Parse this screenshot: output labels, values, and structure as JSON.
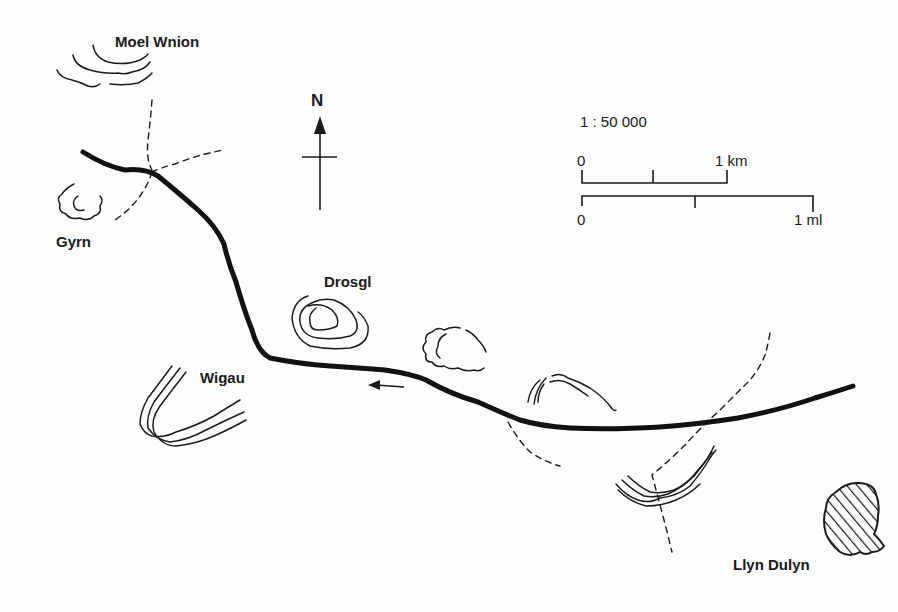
{
  "map": {
    "labels": {
      "moel_wnion": "Moel Wnion",
      "gyrn": "Gyrn",
      "drosgl": "Drosgl",
      "wigau": "Wigau",
      "llyn_dulyn": "Llyn Dulyn"
    },
    "north_arrow": {
      "label": "N"
    },
    "scale": {
      "ratio": "1 : 50 000",
      "km_bar": {
        "start": "0",
        "end": "1 km"
      },
      "mile_bar": {
        "start": "0",
        "end": "1 ml"
      }
    },
    "legend_icons": [
      "north-arrow-icon",
      "direction-arrow-icon",
      "lake-hatch-icon"
    ],
    "colors": {
      "ink": "#1a1a1a",
      "paper": "#fdfdfd"
    }
  }
}
